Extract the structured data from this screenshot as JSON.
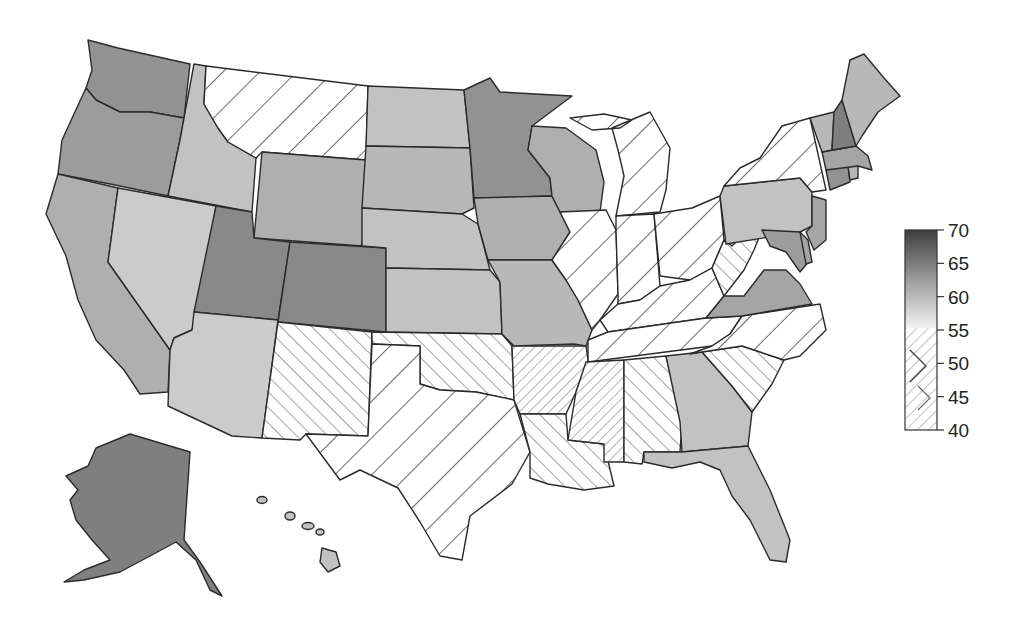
{
  "chart_data": {
    "type": "choropleth",
    "title": "",
    "region": "United States",
    "legend": {
      "position": "right",
      "min": 40,
      "max": 70,
      "ticks": [
        "70",
        "65",
        "60",
        "55",
        "50",
        "45",
        "40"
      ],
      "encoding": {
        "above_53": "grayscale gradient (lighter = lower, darker = higher)",
        "approx_50_53": "wide backslash hatching",
        "approx_45_49": "forward-slash hatching",
        "approx_40_44": "dense backslash hatching"
      }
    },
    "states": [
      {
        "id": "WA",
        "value": 62
      },
      {
        "id": "OR",
        "value": 61
      },
      {
        "id": "CA",
        "value": 59
      },
      {
        "id": "ID",
        "value": 57
      },
      {
        "id": "NV",
        "value": 56
      },
      {
        "id": "MT",
        "value": 51
      },
      {
        "id": "WY",
        "value": 59
      },
      {
        "id": "UT",
        "value": 63
      },
      {
        "id": "CO",
        "value": 63
      },
      {
        "id": "AZ",
        "value": 56
      },
      {
        "id": "NM",
        "value": 47
      },
      {
        "id": "ND",
        "value": 57
      },
      {
        "id": "SD",
        "value": 58
      },
      {
        "id": "NE",
        "value": 57
      },
      {
        "id": "KS",
        "value": 57
      },
      {
        "id": "OK",
        "value": 47
      },
      {
        "id": "TX",
        "value": 51
      },
      {
        "id": "MN",
        "value": 62
      },
      {
        "id": "IA",
        "value": 59
      },
      {
        "id": "MO",
        "value": 58
      },
      {
        "id": "AR",
        "value": 43
      },
      {
        "id": "LA",
        "value": 47
      },
      {
        "id": "WI",
        "value": 59
      },
      {
        "id": "IL",
        "value": 51
      },
      {
        "id": "MI",
        "value": 51
      },
      {
        "id": "IN",
        "value": 51
      },
      {
        "id": "OH",
        "value": 51
      },
      {
        "id": "KY",
        "value": 51
      },
      {
        "id": "TN",
        "value": 51
      },
      {
        "id": "MS",
        "value": 43
      },
      {
        "id": "AL",
        "value": 47
      },
      {
        "id": "GA",
        "value": 57
      },
      {
        "id": "FL",
        "value": 57
      },
      {
        "id": "SC",
        "value": 47
      },
      {
        "id": "NC",
        "value": 51
      },
      {
        "id": "VA",
        "value": 60
      },
      {
        "id": "WV",
        "value": 47
      },
      {
        "id": "PA",
        "value": 57
      },
      {
        "id": "NY",
        "value": 51
      },
      {
        "id": "NJ",
        "value": 60
      },
      {
        "id": "DE",
        "value": 60
      },
      {
        "id": "MD",
        "value": 61
      },
      {
        "id": "CT",
        "value": 62
      },
      {
        "id": "RI",
        "value": 58
      },
      {
        "id": "MA",
        "value": 60
      },
      {
        "id": "VT",
        "value": 58
      },
      {
        "id": "NH",
        "value": 64
      },
      {
        "id": "ME",
        "value": 58
      },
      {
        "id": "AK",
        "value": 64
      },
      {
        "id": "HI",
        "value": 57
      }
    ]
  },
  "colors": {
    "gradient_top": "#3e3e3e",
    "gradient_mid": "#9a9a9a",
    "gradient_bottom": "#f2f2f2",
    "hatch": "#555555",
    "border": "#2b2b2b",
    "background": "#ffffff"
  }
}
